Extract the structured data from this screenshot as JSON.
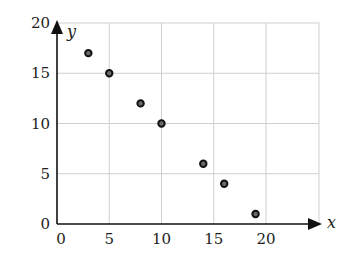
{
  "chart_data": {
    "type": "scatter",
    "title": "",
    "xlabel": "x",
    "ylabel": "y",
    "xlim": [
      0,
      25
    ],
    "ylim": [
      0,
      20
    ],
    "grid": true,
    "legend": null,
    "x_ticks": [
      0,
      5,
      10,
      15,
      20
    ],
    "y_ticks": [
      0,
      5,
      10,
      15,
      20
    ],
    "x_tick_labels": [
      "0",
      "5",
      "10",
      "15",
      "20"
    ],
    "y_tick_labels": [
      "0",
      "5",
      "10",
      "15",
      "20"
    ],
    "series": [
      {
        "name": "points",
        "x": [
          3,
          5,
          8,
          10,
          14,
          16,
          19
        ],
        "y": [
          17,
          15,
          12,
          10,
          6,
          4,
          1
        ]
      }
    ]
  },
  "style": {
    "point_fill": "#6a6a6a",
    "point_stroke": "#111111",
    "grid_color": "#cfcfcf",
    "axis_color": "#111111"
  }
}
